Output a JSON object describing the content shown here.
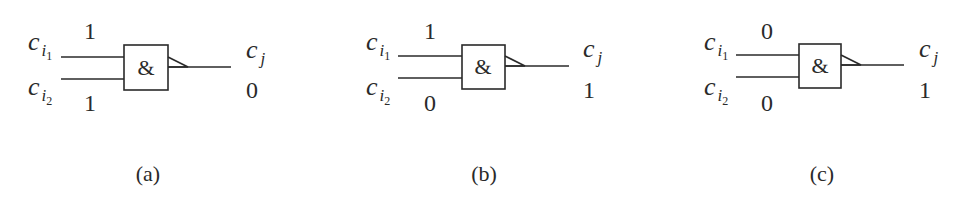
{
  "figure": {
    "gate_symbol": "&",
    "line_color": "#2a2a2a",
    "labels": {
      "input1_base": "c",
      "input1_sub": "i",
      "input1_subsub": "1",
      "input2_base": "c",
      "input2_sub": "i",
      "input2_subsub": "2",
      "output_base": "c",
      "output_sub": "j"
    },
    "panels": [
      {
        "id": "a",
        "caption": "(a)",
        "input1_value": "1",
        "input2_value": "1",
        "output_value": "0"
      },
      {
        "id": "b",
        "caption": "(b)",
        "input1_value": "1",
        "input2_value": "0",
        "output_value": "1"
      },
      {
        "id": "c",
        "caption": "(c)",
        "input1_value": "0",
        "input2_value": "0",
        "output_value": "1"
      }
    ]
  }
}
